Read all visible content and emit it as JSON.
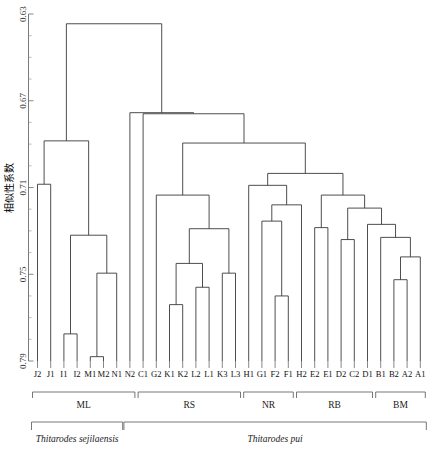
{
  "figure": {
    "type": "dendrogram",
    "y_axis_title": "相似性系数",
    "width": 443,
    "height": 453
  },
  "chart_data": {
    "type": "line",
    "title": "",
    "subtitle": "",
    "xlabel": "",
    "ylabel": "相似性系数",
    "grid": false,
    "legend_position": "none",
    "orientation": "vertical-dendrogram",
    "ylim": [
      0.63,
      0.79
    ],
    "y_axis_inverted": true,
    "y_ticks": [
      0.63,
      0.67,
      0.71,
      0.75,
      0.79
    ],
    "y_tick_labels": [
      "0.63",
      "0.67",
      "0.71",
      "0.75",
      "0.79"
    ],
    "y_minor_tick_step": 0.01,
    "leaf_count": 28,
    "categories": [
      "J2",
      "J1",
      "I1",
      "I2",
      "M1",
      "M2",
      "N1",
      "N2",
      "C1",
      "G2",
      "K1",
      "K2",
      "L2",
      "L1",
      "K3",
      "L3",
      "H1",
      "G1",
      "F2",
      "F1",
      "H2",
      "E2",
      "E1",
      "D2",
      "C2",
      "D1",
      "B1",
      "B2",
      "A2",
      "A1"
    ],
    "leaves": [
      "J2",
      "J1",
      "I1",
      "I2",
      "M1",
      "M2",
      "N1",
      "N2",
      "C1",
      "G2",
      "K1",
      "K2",
      "L2",
      "L1",
      "K3",
      "L3",
      "H1",
      "G1",
      "F2",
      "F1",
      "H2",
      "E2",
      "E1",
      "D2",
      "C2",
      "D1",
      "B1",
      "B2",
      "A2",
      "A1"
    ],
    "leaf_labels": [
      "J2",
      "J1",
      "I1",
      "I2",
      "M1",
      "M2",
      "N1",
      "N2",
      "C1",
      "G2",
      "K1",
      "K2",
      "L2",
      "L1",
      "K3",
      "L3",
      "H1",
      "G1",
      "F2",
      "F1",
      "H2",
      "E2",
      "E1",
      "D2",
      "C2",
      "D1",
      "B1",
      "B2",
      "A2",
      "A1"
    ],
    "merges": [
      {
        "id": "m1",
        "left": "J2",
        "right": "J1",
        "height": 0.7085
      },
      {
        "id": "m2",
        "left": "I1",
        "right": "I2",
        "height": 0.7775
      },
      {
        "id": "m3",
        "left": "M1",
        "right": "M2",
        "height": 0.788
      },
      {
        "id": "m4",
        "left": "m3",
        "right": "N1",
        "height": 0.7495
      },
      {
        "id": "m5",
        "left": "m2",
        "right": "m4",
        "height": 0.732
      },
      {
        "id": "m6",
        "left": "m1",
        "right": "m5",
        "height": 0.6885
      },
      {
        "id": "m7",
        "left": "K1",
        "right": "K2",
        "height": 0.764
      },
      {
        "id": "m8",
        "left": "L2",
        "right": "L1",
        "height": 0.756
      },
      {
        "id": "m9",
        "left": "m7",
        "right": "m8",
        "height": 0.745
      },
      {
        "id": "m10",
        "left": "K3",
        "right": "L3",
        "height": 0.7495
      },
      {
        "id": "m11",
        "left": "m9",
        "right": "m10",
        "height": 0.729
      },
      {
        "id": "m12",
        "left": "G2",
        "right": "m11",
        "height": 0.7135
      },
      {
        "id": "m13",
        "left": "F2",
        "right": "F1",
        "height": 0.76
      },
      {
        "id": "m14",
        "left": "G1",
        "right": "m13",
        "height": 0.7255
      },
      {
        "id": "m15",
        "left": "m14",
        "right": "H2",
        "height": 0.718
      },
      {
        "id": "m16",
        "left": "H1",
        "right": "m15",
        "height": 0.709
      },
      {
        "id": "m17",
        "left": "B2",
        "right": "A2",
        "height": 0.7525
      },
      {
        "id": "m18",
        "left": "m17",
        "right": "A1",
        "height": 0.742
      },
      {
        "id": "m19",
        "left": "B1",
        "right": "m18",
        "height": 0.733
      },
      {
        "id": "m20",
        "left": "D1",
        "right": "m19",
        "height": 0.727
      },
      {
        "id": "m21",
        "left": "D2",
        "right": "C2",
        "height": 0.734
      },
      {
        "id": "m22",
        "left": "m21",
        "right": "m20",
        "height": 0.7195
      },
      {
        "id": "m23",
        "left": "E2",
        "right": "E1",
        "height": 0.7285
      },
      {
        "id": "m24",
        "left": "m23",
        "right": "m22",
        "height": 0.7135
      },
      {
        "id": "m25",
        "left": "m16",
        "right": "m24",
        "height": 0.7035
      },
      {
        "id": "m26",
        "left": "m12",
        "right": "m25",
        "height": 0.6895
      },
      {
        "id": "m27",
        "left": "C1",
        "right": "m26",
        "height": 0.676
      },
      {
        "id": "m28",
        "left": "N2",
        "right": "m27",
        "height": 0.6755
      },
      {
        "id": "m29",
        "left": "m6",
        "right": "m28",
        "height": 0.6345
      }
    ],
    "groups": [
      {
        "label": "ML",
        "first_leaf": "J2",
        "last_leaf": "N2"
      },
      {
        "label": "RS",
        "first_leaf": "C1",
        "last_leaf": "L3"
      },
      {
        "label": "NR",
        "first_leaf": "H1",
        "last_leaf": "F1"
      },
      {
        "label": "RB",
        "first_leaf": "H2",
        "last_leaf": "D1"
      },
      {
        "label": "BM",
        "first_leaf": "B1",
        "last_leaf": "A1"
      }
    ],
    "species": [
      {
        "name": "Thitarodes sejilaensis",
        "first_leaf": "J2",
        "last_leaf": "N1"
      },
      {
        "name": "Thitarodes pui",
        "first_leaf": "N2",
        "last_leaf": "A1"
      }
    ]
  }
}
